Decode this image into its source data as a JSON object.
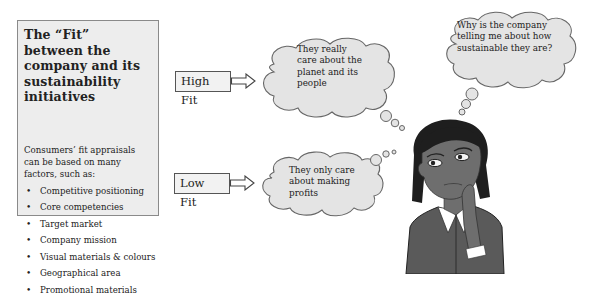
{
  "panel": {
    "title": "The “Fit” between the company and its sustainability initiatives",
    "intro": "Consumers’ fit appraisals can be based on many factors, such as:",
    "factors": [
      "Competitive positioning",
      "Core competencies",
      "Target market",
      "Company mission",
      "Visual materials & colours",
      "Geographical area",
      "Promotional materials"
    ],
    "bullet": "•"
  },
  "fit_levels": {
    "high": {
      "label": "High Fit",
      "thought": "They really care about the planet and its people"
    },
    "low": {
      "label": "Low Fit",
      "thought": "They only care about making profits"
    }
  },
  "consumer_thought": "Why is the company telling me about how sustainable they are?",
  "colors": {
    "panel_bg": "#ededed",
    "cloud_fill": "#e4e4e4",
    "outline": "#666666",
    "figure_skin": "#6e6e6e",
    "figure_hair": "#1e1e1e",
    "figure_jacket": "#5a5a5a"
  }
}
